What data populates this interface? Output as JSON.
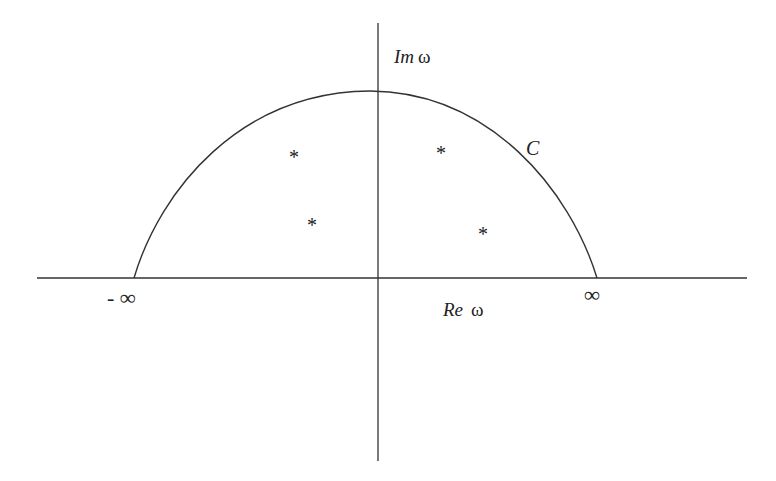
{
  "diagram": {
    "type": "complex-plane-contour",
    "axes": {
      "imaginary_label": {
        "prefix": "Im",
        "symbol": "ω"
      },
      "real_label": {
        "prefix": "Re",
        "symbol": "ω"
      }
    },
    "contour_label": "C",
    "left_infinity": "- ∞",
    "right_infinity": "∞",
    "pole_marker": "*",
    "poles": [
      {
        "x": 294,
        "y": 156
      },
      {
        "x": 312,
        "y": 224
      },
      {
        "x": 441,
        "y": 152
      },
      {
        "x": 483,
        "y": 233
      }
    ],
    "colors": {
      "line": "#333333",
      "text": "#222222",
      "background": "#ffffff"
    }
  }
}
